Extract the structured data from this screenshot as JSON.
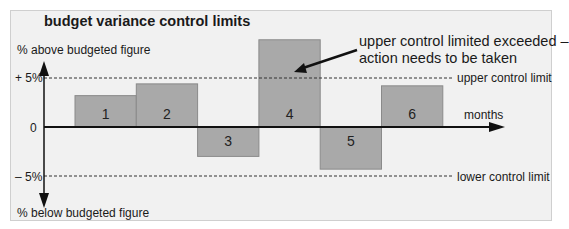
{
  "chart_data": {
    "type": "bar",
    "title": "budget variance control limits",
    "xlabel": "months",
    "ylabel_top": "% above budgeted figure",
    "ylabel_bottom": "% below budgeted figure",
    "categories": [
      "1",
      "2",
      "3",
      "4",
      "5",
      "6"
    ],
    "values": [
      3.2,
      4.4,
      -3.0,
      8.9,
      -4.3,
      4.2
    ],
    "units": "% variance from budget",
    "y_ticks": [
      "+ 5%",
      "0",
      "– 5%"
    ],
    "ylim": [
      -8,
      9
    ],
    "reference_lines": [
      {
        "name": "upper control limit",
        "value": 5,
        "style": "dashed"
      },
      {
        "name": "lower control limit",
        "value": -5,
        "style": "dashed"
      }
    ],
    "annotations": [
      {
        "text": "upper control limited exceeded – action needs to be taken",
        "points_to": "4"
      }
    ],
    "grid": false,
    "legend": "none"
  },
  "labels": {
    "title": "budget variance control limits",
    "y_above": "% above budgeted figure",
    "y_below": "% below budgeted figure",
    "tick_plus5": "+ 5%",
    "tick_zero": "0",
    "tick_minus5": "– 5%",
    "months": "months",
    "upper_limit": "upper control limit",
    "lower_limit": "lower control limit",
    "annotation_line1": "upper control limited exceeded –",
    "annotation_line2": "action needs to be taken"
  },
  "colors": {
    "bar_fill": "#a9a9a9",
    "bar_stroke": "#8a8a8a",
    "background": "#f1f1f1",
    "axis": "#111111"
  }
}
